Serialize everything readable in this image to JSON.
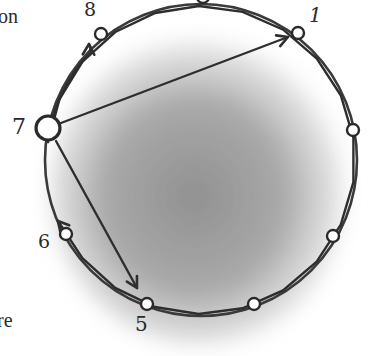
{
  "diagram": {
    "type": "ring",
    "ring": {
      "cx": 201,
      "cy": 160,
      "r": 156,
      "stroke": "#3a3a3a",
      "stroke_width": 2.6
    },
    "shading": {
      "color": "#7a7a7a"
    },
    "nodes": [
      {
        "id": "n8",
        "label": "8",
        "x": 101,
        "y": 34,
        "r": 6,
        "label_x": 84,
        "label_y": 0,
        "label_size": 19
      },
      {
        "id": "ntop",
        "label": "",
        "x": 203,
        "y": -3,
        "r": 6
      },
      {
        "id": "n1",
        "label": "1",
        "x": 298,
        "y": 33,
        "r": 6,
        "label_x": 309,
        "label_y": 5,
        "label_size": 20,
        "label_italic": true
      },
      {
        "id": "nright",
        "label": "",
        "x": 353,
        "y": 130,
        "r": 6
      },
      {
        "id": "nlowright",
        "label": "",
        "x": 333,
        "y": 236,
        "r": 6
      },
      {
        "id": "nbottomright",
        "label": "",
        "x": 254,
        "y": 304,
        "r": 6
      },
      {
        "id": "n5",
        "label": "5",
        "x": 147,
        "y": 304,
        "r": 6,
        "label_x": 135,
        "label_y": 314,
        "label_size": 20
      },
      {
        "id": "n6",
        "label": "6",
        "x": 66,
        "y": 234,
        "r": 6,
        "label_x": 38,
        "label_y": 232,
        "label_size": 19
      },
      {
        "id": "n7",
        "label": "7",
        "x": 48,
        "y": 128,
        "r": 12,
        "label_x": 12,
        "label_y": 116,
        "label_size": 22,
        "emphasized": true
      }
    ],
    "arrows": [
      {
        "from": "7",
        "to": "8",
        "kind": "arc",
        "tip": [
          89,
          44
        ]
      },
      {
        "from": "7",
        "to": "1",
        "kind": "straight",
        "start": [
          61,
          123
        ],
        "tip": [
          288,
          37
        ]
      },
      {
        "from": "7",
        "to": "6",
        "kind": "arc",
        "tip": [
          58,
          221
        ]
      },
      {
        "from": "7",
        "to": "5",
        "kind": "straight",
        "start": [
          56,
          141
        ],
        "tip": [
          137,
          288
        ]
      }
    ]
  },
  "surrounding_text": {
    "top_left_fragment": "on",
    "bottom_left_fragment": "re"
  }
}
